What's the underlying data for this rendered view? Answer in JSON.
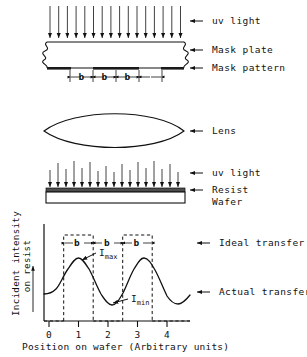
{
  "figure": {
    "line_color": "#111111",
    "fill_mask_pattern": "#1a1a1a",
    "fill_resist": "#4d4d4d"
  },
  "sections": {
    "mask": {
      "uv_label": "uv light",
      "plate_label": "Mask plate",
      "pattern_label": "Mask pattern",
      "uv_ray_count": 16,
      "b_labels": [
        "b",
        "b",
        "b"
      ],
      "pattern_segment_count": 3
    },
    "lens": {
      "label": "Lens"
    },
    "wafer": {
      "uv_label": "uv light",
      "resist_label": "Resist",
      "wafer_label": "Wafer",
      "uv_ray_count": 17
    }
  },
  "chart_data": {
    "type": "line",
    "title": "",
    "xlabel": "Position on wafer (Arbitrary units)",
    "ylabel": "Incident intensity on resist",
    "xticks": [
      0,
      1,
      2,
      3,
      4
    ],
    "xtick_labels": [
      "0",
      "1",
      "2",
      "3",
      "4"
    ],
    "xlim": [
      -0.25,
      4.4
    ],
    "ylim": [
      0,
      1
    ],
    "grid": false,
    "legend_position": "right-inline",
    "series": [
      {
        "name": "Ideal transfer",
        "style": "dashed-rectangles",
        "label": "Ideal transfer",
        "rectangles": [
          {
            "x0": 0.5,
            "x1": 1.5,
            "y0": 0.0,
            "y1": 0.86
          },
          {
            "x0": 2.5,
            "x1": 3.5,
            "y0": 0.0,
            "y1": 0.86
          }
        ]
      },
      {
        "name": "Actual transfer",
        "style": "solid-curve",
        "label": "Actual transfer",
        "x": [
          -0.25,
          0.0,
          0.25,
          0.5,
          0.75,
          1.0,
          1.25,
          1.5,
          1.75,
          2.0,
          2.25,
          2.5,
          2.75,
          3.0,
          3.25,
          3.5,
          3.75,
          4.0,
          4.25,
          4.4
        ],
        "y": [
          0.3,
          0.3,
          0.33,
          0.45,
          0.63,
          0.7,
          0.62,
          0.44,
          0.27,
          0.18,
          0.22,
          0.38,
          0.6,
          0.7,
          0.62,
          0.42,
          0.26,
          0.2,
          0.26,
          0.31
        ]
      }
    ],
    "annotations": [
      {
        "name": "I_max",
        "text": "I",
        "sub": "max",
        "points_to_peak": 1.0,
        "value_ref": 0.7
      },
      {
        "name": "I_min",
        "text": "I",
        "sub": "min",
        "points_to_trough": 2.0,
        "value_ref": 0.18
      }
    ],
    "b_labels": [
      "b",
      "b",
      "b"
    ],
    "b_spans": [
      [
        0.5,
        1.5
      ],
      [
        1.5,
        2.5
      ],
      [
        2.5,
        3.5
      ]
    ]
  }
}
